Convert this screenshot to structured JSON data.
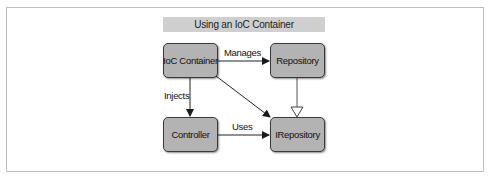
{
  "diagram": {
    "title": "Using an IoC Container",
    "nodes": [
      {
        "id": "ioc-container",
        "label": "IoC Container"
      },
      {
        "id": "repository",
        "label": "Repository"
      },
      {
        "id": "controller",
        "label": "Controller"
      },
      {
        "id": "irepository",
        "label": "IRepository"
      }
    ],
    "edges": [
      {
        "from": "ioc-container",
        "to": "repository",
        "label": "Manages",
        "style": "solid-arrow"
      },
      {
        "from": "ioc-container",
        "to": "controller",
        "label": "Injects",
        "style": "solid-arrow"
      },
      {
        "from": "ioc-container",
        "to": "irepository",
        "label": "",
        "style": "solid-arrow"
      },
      {
        "from": "controller",
        "to": "irepository",
        "label": "Uses",
        "style": "solid-arrow"
      },
      {
        "from": "repository",
        "to": "irepository",
        "label": "",
        "style": "hollow-triangle"
      }
    ]
  },
  "colors": {
    "node_fill": "#b3b3b3",
    "title_fill": "#cfcfcf",
    "frame_border": "#bdbdbd",
    "line": "#222222"
  }
}
